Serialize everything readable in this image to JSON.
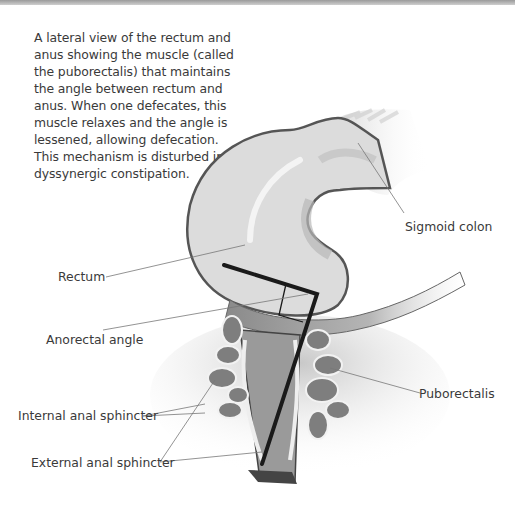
{
  "caption": "A lateral view of the rectum and anus showing the muscle (called the puborectalis) that maintains the angle between rectum and anus. When one defecates, this muscle relaxes and the angle is lessened, allowing defecation. This mechanism is disturbed in dyssynergic constipation.",
  "labels": {
    "sigmoid_colon": "Sigmoid colon",
    "rectum": "Rectum",
    "anorectal_angle": "Anorectal angle",
    "puborectalis": "Puborectalis",
    "internal_anal_sphincter": "Internal anal sphincter",
    "external_anal_sphincter": "External anal sphincter"
  },
  "colors": {
    "topbar": "#b0b0b0",
    "organ_fill": "#dcdcdc",
    "organ_outline": "#555555",
    "angle_line": "#1a1a1a",
    "leader_line": "#777777"
  }
}
